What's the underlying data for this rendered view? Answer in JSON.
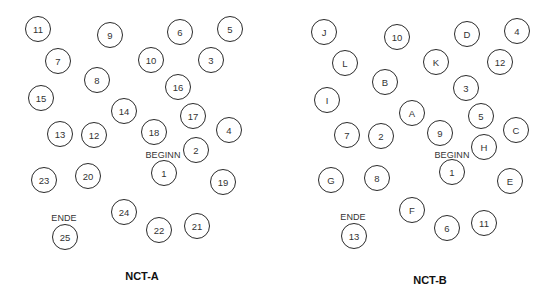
{
  "panels": [
    {
      "title": "NCT-A",
      "title_pos": [
        142,
        270
      ],
      "start_label": "BEGINN",
      "start_label_pos": [
        163,
        150
      ],
      "end_label": "ENDE",
      "end_label_pos": [
        64,
        213
      ],
      "nodes": [
        {
          "label": "11",
          "x": 38,
          "y": 29
        },
        {
          "label": "9",
          "x": 110,
          "y": 35
        },
        {
          "label": "6",
          "x": 180,
          "y": 32
        },
        {
          "label": "5",
          "x": 230,
          "y": 29
        },
        {
          "label": "7",
          "x": 58,
          "y": 61
        },
        {
          "label": "10",
          "x": 151,
          "y": 60
        },
        {
          "label": "3",
          "x": 211,
          "y": 60
        },
        {
          "label": "8",
          "x": 97,
          "y": 80
        },
        {
          "label": "16",
          "x": 178,
          "y": 87
        },
        {
          "label": "15",
          "x": 41,
          "y": 98
        },
        {
          "label": "14",
          "x": 124,
          "y": 111
        },
        {
          "label": "17",
          "x": 193,
          "y": 116
        },
        {
          "label": "18",
          "x": 154,
          "y": 132
        },
        {
          "label": "4",
          "x": 229,
          "y": 130
        },
        {
          "label": "13",
          "x": 60,
          "y": 134
        },
        {
          "label": "12",
          "x": 94,
          "y": 135
        },
        {
          "label": "2",
          "x": 196,
          "y": 150
        },
        {
          "label": "1",
          "x": 164,
          "y": 173
        },
        {
          "label": "19",
          "x": 223,
          "y": 182
        },
        {
          "label": "23",
          "x": 44,
          "y": 180
        },
        {
          "label": "20",
          "x": 88,
          "y": 176
        },
        {
          "label": "24",
          "x": 124,
          "y": 212
        },
        {
          "label": "22",
          "x": 159,
          "y": 230
        },
        {
          "label": "21",
          "x": 197,
          "y": 226
        },
        {
          "label": "25",
          "x": 65,
          "y": 237
        }
      ]
    },
    {
      "title": "NCT-B",
      "title_pos": [
        430,
        274
      ],
      "start_label": "BEGINN",
      "start_label_pos": [
        452,
        150
      ],
      "end_label": "ENDE",
      "end_label_pos": [
        353,
        212
      ],
      "nodes": [
        {
          "label": "J",
          "x": 324,
          "y": 32
        },
        {
          "label": "10",
          "x": 397,
          "y": 37
        },
        {
          "label": "D",
          "x": 467,
          "y": 34
        },
        {
          "label": "4",
          "x": 517,
          "y": 31
        },
        {
          "label": "L",
          "x": 345,
          "y": 63
        },
        {
          "label": "K",
          "x": 436,
          "y": 62
        },
        {
          "label": "12",
          "x": 500,
          "y": 62
        },
        {
          "label": "B",
          "x": 385,
          "y": 82
        },
        {
          "label": "3",
          "x": 466,
          "y": 88
        },
        {
          "label": "I",
          "x": 327,
          "y": 100
        },
        {
          "label": "A",
          "x": 412,
          "y": 113
        },
        {
          "label": "5",
          "x": 481,
          "y": 116
        },
        {
          "label": "C",
          "x": 516,
          "y": 130
        },
        {
          "label": "7",
          "x": 347,
          "y": 135
        },
        {
          "label": "2",
          "x": 381,
          "y": 136
        },
        {
          "label": "9",
          "x": 440,
          "y": 133
        },
        {
          "label": "H",
          "x": 484,
          "y": 147
        },
        {
          "label": "1",
          "x": 452,
          "y": 172
        },
        {
          "label": "G",
          "x": 331,
          "y": 180
        },
        {
          "label": "8",
          "x": 377,
          "y": 178
        },
        {
          "label": "E",
          "x": 510,
          "y": 181
        },
        {
          "label": "F",
          "x": 412,
          "y": 210
        },
        {
          "label": "6",
          "x": 447,
          "y": 228
        },
        {
          "label": "11",
          "x": 484,
          "y": 223
        },
        {
          "label": "13",
          "x": 354,
          "y": 236
        }
      ]
    }
  ]
}
